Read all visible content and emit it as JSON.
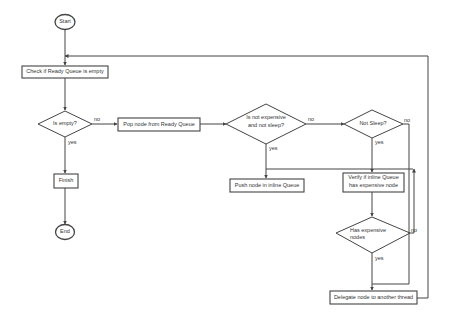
{
  "diagram": {
    "type": "flowchart",
    "colors": {
      "stroke": "#444444",
      "background": "#ffffff",
      "text": "#333333"
    },
    "nodes": {
      "start": {
        "shape": "terminal",
        "label": "Start"
      },
      "check_ready": {
        "shape": "process",
        "label": "Check if Ready Queue is empty"
      },
      "is_empty": {
        "shape": "decision",
        "label": "Is empty?"
      },
      "finish": {
        "shape": "process",
        "label": "Finish"
      },
      "end": {
        "shape": "terminal",
        "label": "End"
      },
      "pop_node": {
        "shape": "process",
        "label": "Pop node from Ready Queue"
      },
      "not_expensive": {
        "shape": "decision",
        "label_line1": "Is not expensive",
        "label_line2": "and not sleep?"
      },
      "not_sleep": {
        "shape": "decision",
        "label": "Not Sleep?"
      },
      "push_inline": {
        "shape": "process",
        "label": "Push node in inline Queue"
      },
      "verify_inline": {
        "shape": "process",
        "label_line1": "Verify if inline Queue",
        "label_line2": "has expensive node"
      },
      "has_expensive": {
        "shape": "decision",
        "label_line1": "Has expensive",
        "label_line2": "nodes"
      },
      "delegate": {
        "shape": "process",
        "label": "Delegate node to another thread"
      }
    },
    "edge_labels": {
      "is_empty_no": "no",
      "is_empty_yes": "yes",
      "not_expensive_no": "no",
      "not_expensive_yes": "yes",
      "not_sleep_no": "no",
      "not_sleep_yes": "yes",
      "has_expensive_no": "no",
      "has_expensive_yes": "yes"
    }
  }
}
